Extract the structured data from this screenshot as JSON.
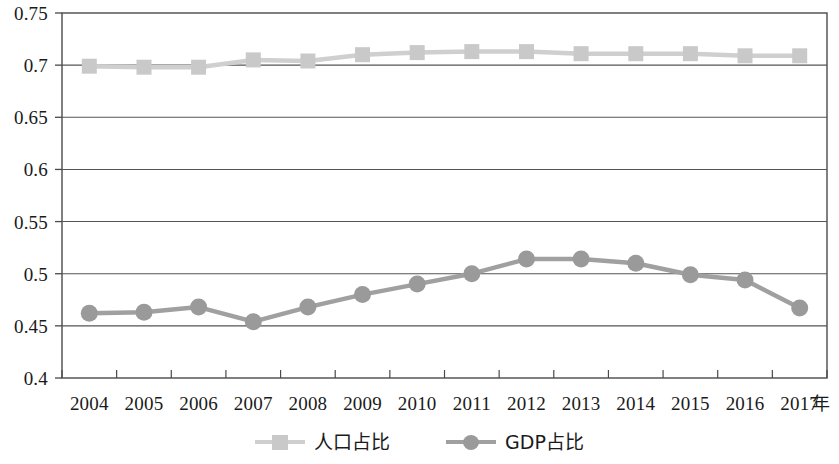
{
  "chart_data": {
    "type": "line",
    "title": "",
    "subtitle": "",
    "xlabel": "年",
    "ylabel": "",
    "categories": [
      "2004",
      "2005",
      "2006",
      "2007",
      "2008",
      "2009",
      "2010",
      "2011",
      "2012",
      "2013",
      "2014",
      "2015",
      "2016",
      "2017"
    ],
    "ylim": [
      0.4,
      0.75
    ],
    "ytick_labels": [
      "0.75",
      "0.7",
      "0.65",
      "0.6",
      "0.55",
      "0.5",
      "0.45",
      "0.4"
    ],
    "ytick_values": [
      0.75,
      0.7,
      0.65,
      0.6,
      0.55,
      0.5,
      0.45,
      0.4
    ],
    "grid": true,
    "grid_axis": "y",
    "legend_position": "bottom-center",
    "series": [
      {
        "name": "人口占比",
        "marker": "square",
        "color": "#c9c9c9",
        "line_color": "#cfcfcf",
        "values": [
          0.699,
          0.698,
          0.698,
          0.705,
          0.704,
          0.71,
          0.712,
          0.713,
          0.713,
          0.711,
          0.711,
          0.711,
          0.709,
          0.709
        ]
      },
      {
        "name": "GDP占比",
        "marker": "circle",
        "color": "#9a9a9a",
        "line_color": "#a0a0a0",
        "values": [
          0.462,
          0.463,
          0.468,
          0.454,
          0.468,
          0.48,
          0.49,
          0.5,
          0.514,
          0.514,
          0.51,
          0.499,
          0.494,
          0.467
        ]
      }
    ]
  },
  "axes": {
    "frame_color": "#4a4a4a",
    "grid_color": "#555555"
  }
}
